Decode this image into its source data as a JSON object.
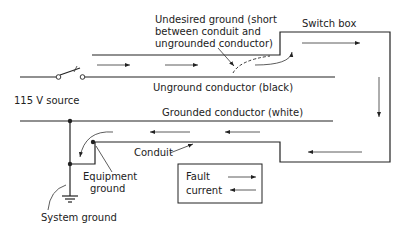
{
  "diagram": {
    "labels": {
      "source": "115 V source",
      "undesired_ground_line1": "Undesired ground (short",
      "undesired_ground_line2": "between conduit and",
      "undesired_ground_line3": "ungrounded conductor)",
      "switch_box": "Switch box",
      "ungrounded_conductor": "Unground conductor (black)",
      "grounded_conductor": "Grounded conductor (white)",
      "conduit": "Conduit",
      "equipment_ground_line1": "Equipment",
      "equipment_ground_line2": "ground",
      "system_ground": "System ground"
    },
    "legend": {
      "line1": "Fault",
      "line2": "current"
    },
    "colors": {
      "line": "#222222",
      "background": "#ffffff"
    }
  }
}
